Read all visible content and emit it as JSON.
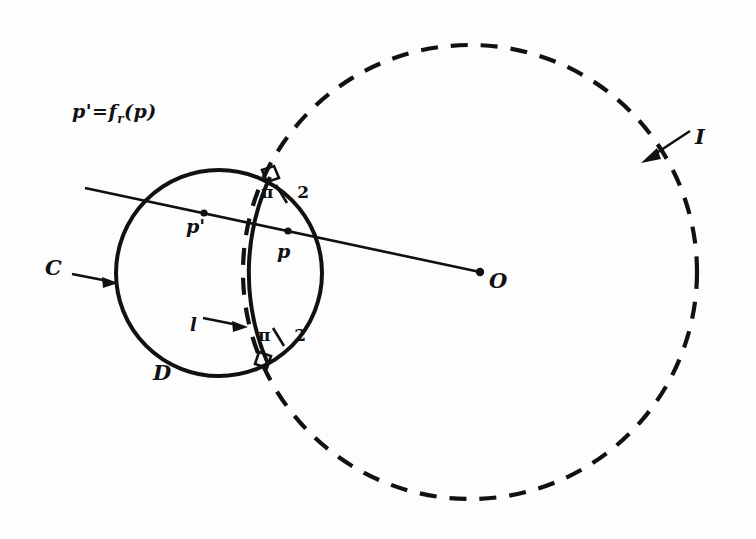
{
  "figure": {
    "background_color": "#fdfdfd",
    "ink_color": "#111111",
    "formula": {
      "full": "p' = f_r(p)",
      "lhs": "p'",
      "equals": "=",
      "function": "f",
      "subscript": "r",
      "argument": "(p)"
    },
    "labels": {
      "center_point": "O",
      "dashed_circle": "I",
      "solid_circle": "C",
      "disk": "D",
      "point_p": "p",
      "point_p_prime": "p'",
      "arc": "l"
    },
    "angles": [
      {
        "name": "upper-right-angle",
        "value": "π",
        "denominator": "2",
        "display": "π/2"
      },
      {
        "name": "lower-right-angle",
        "value": "π",
        "denominator": "2",
        "display": "π/2"
      }
    ],
    "geometry": {
      "solid_circle": {
        "cx": 219,
        "cy": 273,
        "r": 103,
        "stroke": "#111111",
        "style": "solid"
      },
      "dashed_circle": {
        "cx": 470,
        "cy": 272,
        "r": 227,
        "stroke": "#111111",
        "style": "dashed"
      },
      "ray": {
        "x1": 85,
        "y1": 188,
        "x2": 480,
        "y2": 272
      },
      "points": [
        {
          "name": "p-prime",
          "x": 204,
          "y": 213
        },
        {
          "name": "p",
          "x": 288,
          "y": 231
        },
        {
          "name": "O",
          "x": 480,
          "y": 272
        }
      ],
      "arc_chord_endpoints": [
        {
          "name": "upper-intersection",
          "x": 270,
          "y": 177
        },
        {
          "name": "lower-intersection",
          "x": 268,
          "y": 364
        }
      ]
    },
    "arrows": [
      {
        "name": "arrow-to-circle-C",
        "from_x": 72,
        "from_y": 274,
        "to_x": 112,
        "to_y": 282
      },
      {
        "name": "arrow-to-circle-I",
        "from_x": 690,
        "from_y": 131,
        "to_x": 645,
        "to_y": 159
      },
      {
        "name": "arrow-to-arc-l",
        "from_x": 203,
        "from_y": 318,
        "to_x": 243,
        "to_y": 327
      }
    ]
  }
}
